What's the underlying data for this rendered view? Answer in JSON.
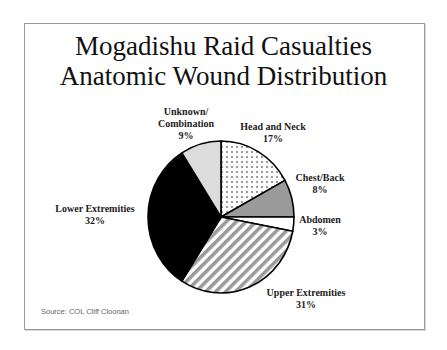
{
  "slide": {
    "title_line1": "Mogadishu Raid Casualties",
    "title_line2": "Anatomic Wound Distribution",
    "source": "Source:  COL Cliff Cloonan"
  },
  "labels": {
    "unknown": {
      "line1": "Unknown/",
      "line2": "Combination",
      "pct": "9%"
    },
    "head": {
      "line1": "Head and Neck",
      "pct": "17%"
    },
    "chest": {
      "line1": "Chest/Back",
      "pct": "8%"
    },
    "abdomen": {
      "line1": "Abdomen",
      "pct": "3%"
    },
    "upper": {
      "line1": "Upper Extremities",
      "pct": "31%"
    },
    "lower": {
      "line1": "Lower Extremities",
      "pct": "32%"
    }
  },
  "chart_data": {
    "type": "pie",
    "categories": [
      "Head and Neck",
      "Chest/Back",
      "Abdomen",
      "Upper Extremities",
      "Lower Extremities",
      "Unknown/Combination"
    ],
    "values": [
      17,
      8,
      3,
      31,
      32,
      9
    ],
    "unit": "%",
    "start_angle": "12 o'clock, clockwise",
    "fills": {
      "Head and Neck": "dotted gray on white",
      "Chest/Back": "#9a9a9a",
      "Abdomen": "#ffffff",
      "Upper Extremities": "gray diagonal stripes",
      "Lower Extremities": "#000000",
      "Unknown/Combination": "#dcdcdc"
    },
    "legend": "none (direct labels)",
    "annotation": "Source:  COL Cliff Cloonan"
  }
}
